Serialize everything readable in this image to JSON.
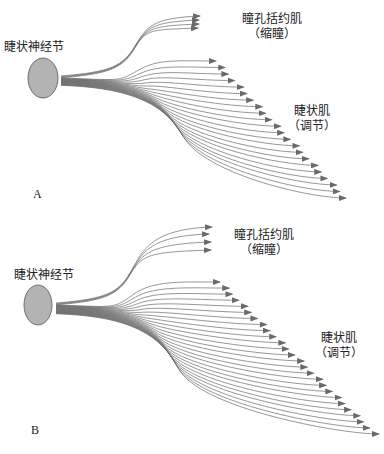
{
  "panels": [
    {
      "letter": "A",
      "ganglion_label": "睫状神经节",
      "sphincter_label": "瞳孔括约肌",
      "sphincter_sub": "（缩瞳）",
      "ciliary_label": "睫状肌",
      "ciliary_sub": "（调节）"
    },
    {
      "letter": "B",
      "ganglion_label": "睫状神经节",
      "sphincter_label": "瞳孔括约肌",
      "sphincter_sub": "（缩瞳）",
      "ciliary_label": "睫状肌",
      "ciliary_sub": "（调节）"
    }
  ],
  "colors": {
    "ganglion_fill": "#b3b3b3",
    "ganglion_stroke": "#555555",
    "fiber": "#6a6a6a",
    "text": "#222222"
  }
}
